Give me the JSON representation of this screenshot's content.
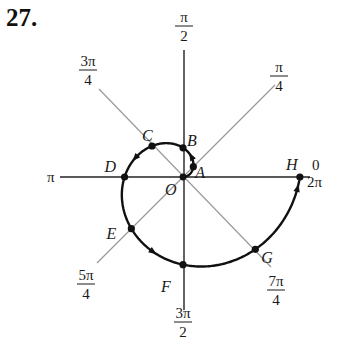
{
  "problem_number": "27.",
  "diagram": {
    "type": "polar-graph",
    "curve": "archimedean spiral r = θ, 0 ≤ θ ≤ 2π",
    "origin": {
      "label": "O",
      "x": 183,
      "y": 177
    },
    "scale_px_per_unit": 18.6,
    "colors": {
      "curve": "#111111",
      "axis": "#222222",
      "ray": "#9a9a9a",
      "point": "#111111"
    },
    "angle_labels": [
      {
        "id": "0",
        "num": "0",
        "den": "",
        "extra": "2π",
        "x": 312,
        "y": 170
      },
      {
        "id": "pi-4",
        "num": "π",
        "den": "4",
        "x": 279,
        "y": 72
      },
      {
        "id": "pi-2",
        "num": "π",
        "den": "2",
        "x": 184,
        "y": 22
      },
      {
        "id": "3pi-4",
        "num": "3π",
        "den": "4",
        "x": 88,
        "y": 66
      },
      {
        "id": "pi",
        "num": "π",
        "den": "",
        "x": 47,
        "y": 182
      },
      {
        "id": "5pi-4",
        "num": "5π",
        "den": "4",
        "x": 86,
        "y": 280
      },
      {
        "id": "3pi-2",
        "num": "3π",
        "den": "2",
        "x": 183,
        "y": 318
      },
      {
        "id": "7pi-4",
        "num": "7π",
        "den": "4",
        "x": 276,
        "y": 286
      }
    ],
    "points": [
      {
        "label": "A",
        "theta_over_pi": 0.25,
        "lx": 7,
        "ly": 6
      },
      {
        "label": "B",
        "theta_over_pi": 0.5,
        "lx": 9,
        "ly": -7
      },
      {
        "label": "C",
        "theta_over_pi": 0.75,
        "lx": -5,
        "ly": -10
      },
      {
        "label": "D",
        "theta_over_pi": 1.0,
        "lx": -15,
        "ly": -10
      },
      {
        "label": "E",
        "theta_over_pi": 1.25,
        "lx": -20,
        "ly": 5
      },
      {
        "label": "F",
        "theta_over_pi": 1.5,
        "lx": -17,
        "ly": 22
      },
      {
        "label": "G",
        "theta_over_pi": 1.75,
        "lx": 11,
        "ly": 9
      },
      {
        "label": "H",
        "theta_over_pi": 2.0,
        "lx": -9,
        "ly": -12
      }
    ],
    "arrows_at_theta_over_pi": [
      0.38,
      0.88,
      1.38,
      1.97
    ]
  }
}
